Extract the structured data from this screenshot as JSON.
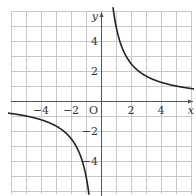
{
  "chart_data": {
    "type": "line",
    "title": "",
    "function": "y = 5/x",
    "xlabel": "x",
    "ylabel": "y",
    "origin_label": "O",
    "xlim": [
      -6,
      6
    ],
    "ylim": [
      -6,
      6
    ],
    "grid": true,
    "grid_step": 1,
    "x_ticks": [
      -4,
      -2,
      2,
      4
    ],
    "x_tick_labels": [
      "−4",
      "−2",
      "2",
      "4"
    ],
    "y_ticks": [
      4,
      2,
      -2,
      -4
    ],
    "y_tick_labels": [
      "4",
      "2",
      "−2",
      "−4"
    ],
    "series": [
      {
        "name": "right branch",
        "x": [
          0.85,
          1,
          1.25,
          1.5,
          2,
          2.5,
          3,
          4,
          5,
          6
        ],
        "y": [
          5.88,
          5,
          4,
          3.33,
          2.5,
          2,
          1.67,
          1.25,
          1,
          0.83
        ]
      },
      {
        "name": "left branch",
        "x": [
          -6,
          -5,
          -4,
          -3,
          -2.5,
          -2,
          -1.5,
          -1.25,
          -1,
          -0.85
        ],
        "y": [
          -0.83,
          -1,
          -1.25,
          -1.67,
          -2,
          -2.5,
          -3.33,
          -4,
          -5,
          -5.88
        ]
      }
    ],
    "colors": {
      "curve": "#222222",
      "grid": "#c8c8c8",
      "axis": "#555555"
    }
  }
}
